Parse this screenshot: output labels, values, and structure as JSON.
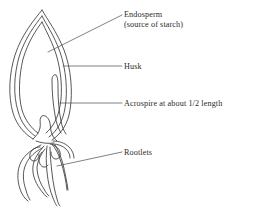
{
  "figure": {
    "background_color": "#ffffff",
    "ink_color": "#3a3a3a",
    "leader_color": "#4a4a4a"
  },
  "labels": [
    {
      "id": "endosperm",
      "text": "Endosperm",
      "subtext": "(source of starch)",
      "leader": "diagonal down-left into grain interior"
    },
    {
      "id": "husk",
      "text": "Husk",
      "subtext": "",
      "leader": "horizontal to outer grain wall"
    },
    {
      "id": "acrospire",
      "text": "Acrospire at about 1/2 length",
      "subtext": "",
      "leader": "horizontal to acrospire sliver"
    },
    {
      "id": "rootlets",
      "text": "Rootlets",
      "subtext": "",
      "leader": "diagonal down-left to a rootlet"
    }
  ],
  "parts": [
    {
      "name": "grain-outline-outer",
      "description": "pointed spindle husk outline"
    },
    {
      "name": "grain-outline-inner",
      "description": "inner husk line parallel to outer"
    },
    {
      "name": "endosperm-body",
      "description": "interior mass of the grain"
    },
    {
      "name": "acrospire",
      "description": "narrow shoot running about half the grain length"
    },
    {
      "name": "embryo-base",
      "description": "narrowed neck at grain base"
    },
    {
      "name": "rootlets",
      "description": "five curving tapering rootlets"
    }
  ]
}
